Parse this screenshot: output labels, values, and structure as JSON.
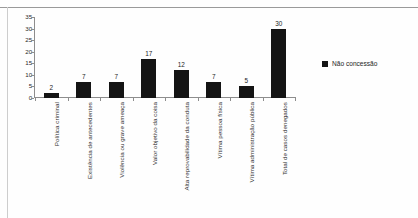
{
  "chart_data": {
    "type": "bar",
    "title": "",
    "xlabel": "",
    "ylabel": "",
    "ylim": [
      0,
      35
    ],
    "ytick_step": 5,
    "grid": false,
    "legend_position": "right",
    "bar_color": "#141414",
    "axis_color": "#8d8d8d",
    "yticks": [
      "35",
      "30",
      "25",
      "20",
      "15",
      "10",
      "5",
      "0"
    ],
    "categories": [
      "Política criminal",
      "Existência de antecedentes",
      "Violência ou grave ameaça",
      "Valor objetivo da coisa",
      "Alta reprovabilidade da conduta",
      "Vítima pessoa física",
      "Vítima administração pública",
      "Total de casos denegados"
    ],
    "values": [
      2,
      7,
      7,
      17,
      12,
      7,
      5,
      30
    ],
    "value_labels": [
      "2",
      "7",
      "7",
      "17",
      "12",
      "7",
      "5",
      "30"
    ],
    "series": [
      {
        "name": "Não concessão",
        "values": [
          2,
          7,
          7,
          17,
          12,
          7,
          5,
          30
        ]
      }
    ],
    "legend": [
      {
        "label": "Não concessão",
        "color": "#141414",
        "marker": "square"
      }
    ]
  }
}
